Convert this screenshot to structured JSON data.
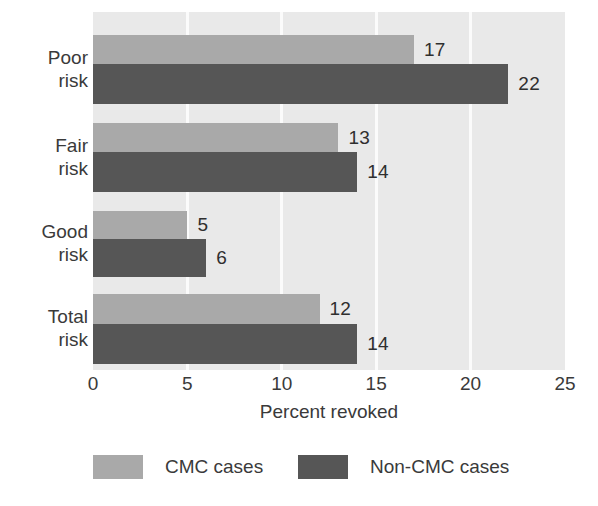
{
  "chart_data": {
    "type": "bar",
    "orientation": "horizontal",
    "title": "",
    "xlabel": "Percent revoked",
    "ylabel": "",
    "xlim": [
      0,
      25
    ],
    "xticks": [
      0,
      5,
      10,
      15,
      20,
      25
    ],
    "xtick_labels": [
      "0",
      "5",
      "10",
      "15",
      "20",
      "25"
    ],
    "grid": "vertical-white-gridlines",
    "legend_position": "bottom-center",
    "categories": [
      "Poor\nrisk",
      "Fair\nrisk",
      "Good\nrisk",
      "Total\nrisk"
    ],
    "series": [
      {
        "name": "CMC cases",
        "color": "#a9a9a9",
        "values": [
          17,
          13,
          5,
          12
        ],
        "value_labels": [
          "17",
          "13",
          "5",
          "12"
        ]
      },
      {
        "name": "Non-CMC cases",
        "color": "#565656",
        "values": [
          22,
          14,
          6,
          14
        ],
        "value_labels": [
          "22",
          "14",
          "6",
          "14"
        ]
      }
    ],
    "plot_background": "#e9e9e9",
    "gridline_color": "#fbfbfb"
  },
  "axis": {
    "x_title": "Percent revoked",
    "ticks": [
      {
        "value": 0,
        "label": "0"
      },
      {
        "value": 5,
        "label": "5"
      },
      {
        "value": 10,
        "label": "10"
      },
      {
        "value": 15,
        "label": "15"
      },
      {
        "value": 20,
        "label": "20"
      },
      {
        "value": 25,
        "label": "25"
      }
    ]
  },
  "categories": [
    {
      "label": "Poor\nrisk"
    },
    {
      "label": "Fair\nrisk"
    },
    {
      "label": "Good\nrisk"
    },
    {
      "label": "Total\nrisk"
    }
  ],
  "bars": [
    {
      "group": 0,
      "series": "CMC cases",
      "value": 17,
      "label": "17",
      "tone": "light"
    },
    {
      "group": 0,
      "series": "Non-CMC cases",
      "value": 22,
      "label": "22",
      "tone": "dark"
    },
    {
      "group": 1,
      "series": "CMC cases",
      "value": 13,
      "label": "13",
      "tone": "light"
    },
    {
      "group": 1,
      "series": "Non-CMC cases",
      "value": 14,
      "label": "14",
      "tone": "dark"
    },
    {
      "group": 2,
      "series": "CMC cases",
      "value": 5,
      "label": "5",
      "tone": "light"
    },
    {
      "group": 2,
      "series": "Non-CMC cases",
      "value": 6,
      "label": "6",
      "tone": "dark"
    },
    {
      "group": 3,
      "series": "CMC cases",
      "value": 12,
      "label": "12",
      "tone": "light"
    },
    {
      "group": 3,
      "series": "Non-CMC cases",
      "value": 14,
      "label": "14",
      "tone": "dark"
    }
  ],
  "legend": [
    {
      "label": "CMC cases",
      "tone": "light",
      "color": "#a9a9a9"
    },
    {
      "label": "Non-CMC cases",
      "tone": "dark",
      "color": "#565656"
    }
  ]
}
